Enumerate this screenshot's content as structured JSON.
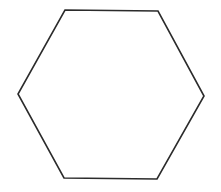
{
  "diagram": {
    "shape": "hexagon",
    "orientation": "flat-top",
    "vertices": [
      [
        65,
        10
      ],
      [
        158,
        11
      ],
      [
        204,
        96
      ],
      [
        157,
        179
      ],
      [
        64,
        178
      ],
      [
        18,
        94
      ]
    ],
    "stroke_color": "#2b2b2b",
    "stroke_width": 1.6,
    "fill_color": "#ffffff",
    "background_color": "#ffffff"
  }
}
